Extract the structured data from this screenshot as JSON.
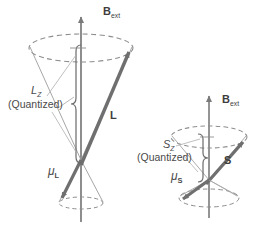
{
  "figure": {
    "background_color": "#ffffff",
    "ink_color": "#4a4a4a",
    "vector_color": "#6b6b6b",
    "cone_color": "#8d8d8d"
  },
  "diagrams": [
    {
      "id": "orbital",
      "name": "orbital-angular-momentum-diagram",
      "field_label": {
        "base": "B",
        "sub": "ext"
      },
      "vector_label": {
        "base": "L",
        "sub": ""
      },
      "projection_label": {
        "base": "L",
        "sub": "Z"
      },
      "projection_note": "(Quantized)",
      "moment_label": {
        "base": "μ",
        "sub": "L"
      }
    },
    {
      "id": "spin",
      "name": "spin-angular-momentum-diagram",
      "field_label": {
        "base": "B",
        "sub": "ext"
      },
      "vector_label": {
        "base": "S",
        "sub": ""
      },
      "projection_label": {
        "base": "S",
        "sub": "Z"
      },
      "projection_note": "(Quantized)",
      "moment_label": {
        "base": "μ",
        "sub": "S"
      }
    }
  ],
  "labels": {
    "left_field": "B",
    "left_field_sub": "ext",
    "left_vector": "L",
    "left_projection": "L",
    "left_projection_sub": "Z",
    "left_quantized": "(Quantized)",
    "left_moment": "μ",
    "left_moment_sub": "L",
    "right_field": "B",
    "right_field_sub": "ext",
    "right_vector": "S",
    "right_projection": "S",
    "right_projection_sub": "Z",
    "right_quantized": "(Quantized)",
    "right_moment": "μ",
    "right_moment_sub": "S"
  }
}
